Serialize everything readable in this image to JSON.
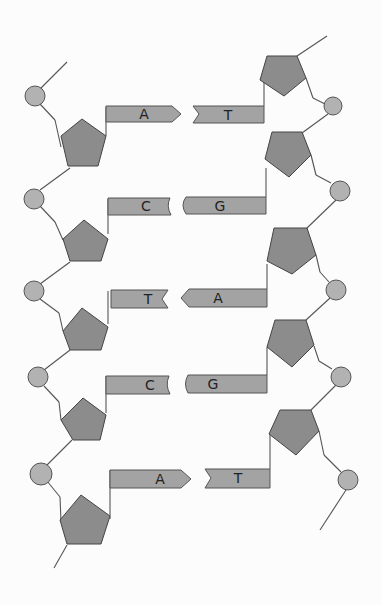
{
  "diagram": {
    "type": "DNA double helix segment (schematic)",
    "colors": {
      "sugar": "#8c8c8c",
      "phosphate": "#b2b2b2",
      "base": "#a3a3a3",
      "line": "#555555",
      "background": "#fcfcfc"
    },
    "base_pairs": [
      {
        "left": "A",
        "right": "T",
        "left_shape": "arrow",
        "right_shape": "notch"
      },
      {
        "left": "C",
        "right": "G",
        "left_shape": "cup",
        "right_shape": "round"
      },
      {
        "left": "T",
        "right": "A",
        "left_shape": "notch",
        "right_shape": "arrow"
      },
      {
        "left": "C",
        "right": "G",
        "left_shape": "cup",
        "right_shape": "round"
      },
      {
        "left": "A",
        "right": "T",
        "left_shape": "arrow",
        "right_shape": "notch"
      }
    ]
  }
}
